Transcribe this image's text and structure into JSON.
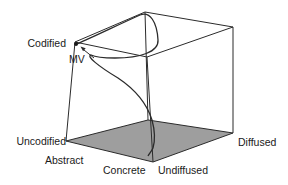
{
  "figure": {
    "colors": {
      "background": "#ffffff",
      "line": "#2b2b2b",
      "floor_fill": "#9e9e9e",
      "text": "#1a1a1a"
    },
    "labels": {
      "codified": "Codified",
      "uncodified": "Uncodified",
      "abstract": "Abstract",
      "concrete": "Concrete",
      "undiffused": "Undiffused",
      "diffused": "Diffused",
      "mv": "MV"
    },
    "marker": {
      "label": "MV",
      "type": "dot-with-arrow",
      "position": "top-left corner of cube (codified / abstract / undiffused)"
    }
  }
}
